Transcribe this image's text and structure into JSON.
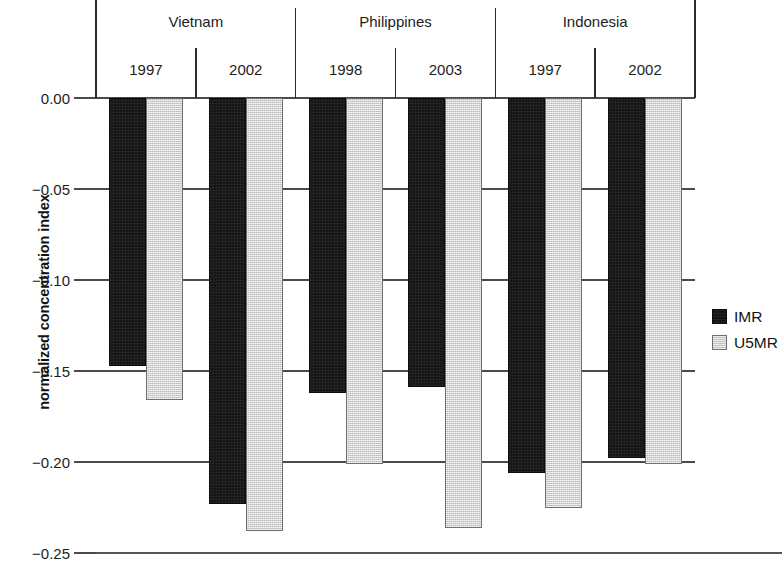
{
  "chart_data": {
    "type": "bar",
    "title": "",
    "subtitle": "",
    "xlabel": "",
    "ylabel": "normalized concentration index",
    "ylim": [
      -0.25,
      0.0
    ],
    "yticks": [
      0.0,
      -0.05,
      -0.1,
      -0.15,
      -0.2,
      -0.25
    ],
    "ytick_labels": [
      "0.00",
      "−0.05",
      "−0.10",
      "−0.15",
      "−0.20",
      "−0.25"
    ],
    "grid": true,
    "legend_position": "right",
    "orientation": "vertical",
    "categories": [
      "Vietnam 1997",
      "Vietnam 2002",
      "Philippines 1998",
      "Philippines 2003",
      "Indonesia 1997",
      "Indonesia 2002"
    ],
    "groups": [
      {
        "country": "Vietnam",
        "years": [
          "1997",
          "2002"
        ]
      },
      {
        "country": "Philippines",
        "years": [
          "1998",
          "2003"
        ]
      },
      {
        "country": "Indonesia",
        "years": [
          "1997",
          "2002"
        ]
      }
    ],
    "series": [
      {
        "name": "IMR",
        "color": "#151515",
        "values": [
          -0.147,
          -0.223,
          -0.162,
          -0.159,
          -0.206,
          -0.198
        ]
      },
      {
        "name": "U5MR",
        "color": "#d6d6d6",
        "values": [
          -0.166,
          -0.238,
          -0.201,
          -0.236,
          -0.225,
          -0.201
        ]
      }
    ]
  },
  "legend": {
    "items": [
      {
        "label": "IMR",
        "swatch": "black-square-icon"
      },
      {
        "label": "U5MR",
        "swatch": "gray-square-icon"
      }
    ]
  }
}
